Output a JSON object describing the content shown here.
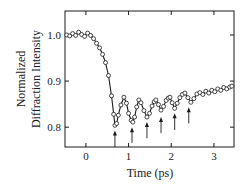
{
  "chart_data": {
    "type": "line",
    "title": "",
    "xlabel": "Time (ps)",
    "ylabel": "Normalized Diffraction Intensity",
    "ylabel_lines": [
      "Normalized",
      "Diffraction Intensity"
    ],
    "xlim": [
      -0.49,
      3.47
    ],
    "ylim": [
      0.757,
      1.052
    ],
    "xticks": [
      0,
      1,
      2,
      3
    ],
    "xtick_labels": [
      "0",
      "1",
      "2",
      "3"
    ],
    "yticks": [
      0.8,
      0.9,
      1.0
    ],
    "ytick_labels": [
      "0.8",
      "0.9",
      "1.0"
    ],
    "grid": false,
    "legend": null,
    "series": [
      {
        "name": "Diffraction intensity (reconstructed)",
        "marker": "open-circle",
        "line": "solid",
        "note": "Only the baseline, labeled extrema, and tail are read from the figure; intermediate points are interpolated.",
        "x": [
          -0.45,
          -0.38,
          -0.31,
          -0.24,
          -0.17,
          -0.1,
          -0.03,
          0.04,
          0.11,
          0.18,
          0.25,
          0.32,
          0.39,
          0.46,
          0.53,
          0.6,
          0.65,
          0.68,
          0.72,
          0.76,
          0.82,
          0.89,
          0.95,
          1.0,
          1.06,
          1.1,
          1.14,
          1.19,
          1.24,
          1.29,
          1.36,
          1.43,
          1.49,
          1.55,
          1.6,
          1.64,
          1.7,
          1.76,
          1.82,
          1.88,
          1.93,
          1.97,
          2.02,
          2.08,
          2.14,
          2.2,
          2.26,
          2.32,
          2.39,
          2.46,
          2.53,
          2.6,
          2.67,
          2.74,
          2.81,
          2.88,
          2.95,
          3.02,
          3.09,
          3.16,
          3.23,
          3.3,
          3.37,
          3.42
        ],
        "values": [
          1.0,
          0.998,
          1.003,
          0.999,
          1.006,
          1.001,
          0.997,
          1.004,
          0.999,
          0.992,
          0.982,
          0.972,
          0.958,
          0.94,
          0.912,
          0.868,
          0.828,
          0.804,
          0.808,
          0.826,
          0.848,
          0.865,
          0.852,
          0.83,
          0.815,
          0.811,
          0.822,
          0.844,
          0.859,
          0.853,
          0.836,
          0.822,
          0.83,
          0.846,
          0.855,
          0.859,
          0.849,
          0.837,
          0.845,
          0.858,
          0.863,
          0.865,
          0.853,
          0.841,
          0.852,
          0.864,
          0.871,
          0.874,
          0.864,
          0.854,
          0.862,
          0.872,
          0.875,
          0.871,
          0.878,
          0.874,
          0.88,
          0.877,
          0.883,
          0.88,
          0.886,
          0.883,
          0.887,
          0.889
        ]
      }
    ],
    "annotations": [
      {
        "type": "arrow",
        "x": 0.68,
        "y_tip": 0.793,
        "y_base": 0.757
      },
      {
        "type": "arrow",
        "x": 1.08,
        "y_tip": 0.8,
        "y_base": 0.766
      },
      {
        "type": "arrow",
        "x": 1.43,
        "y_tip": 0.811,
        "y_base": 0.776
      },
      {
        "type": "arrow",
        "x": 1.76,
        "y_tip": 0.822,
        "y_base": 0.787
      },
      {
        "type": "arrow",
        "x": 2.08,
        "y_tip": 0.83,
        "y_base": 0.794
      },
      {
        "type": "arrow",
        "x": 2.41,
        "y_tip": 0.843,
        "y_base": 0.808
      }
    ]
  }
}
